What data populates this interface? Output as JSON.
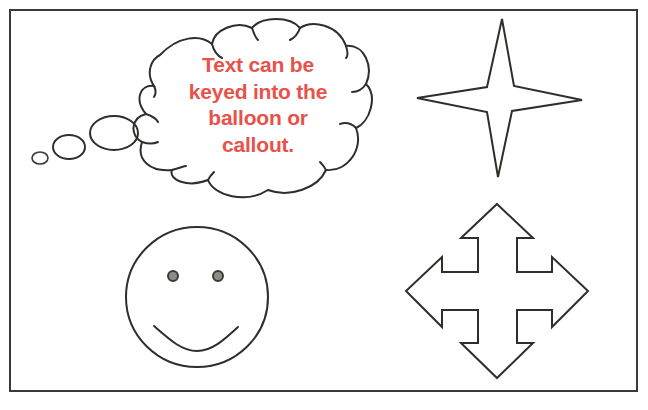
{
  "figure": {
    "frame": {
      "x": 9,
      "y": 9,
      "width": 627,
      "height": 381
    },
    "stroke_color": "#2e2e2a",
    "background": "#ffffff"
  },
  "callout": {
    "type": "thought-balloon",
    "text_lines": [
      "Text can be",
      "keyed into the",
      "balloon or",
      "callout."
    ],
    "text_color": "#e8524a",
    "thought_bubbles": [
      {
        "cx": 40,
        "cy": 158,
        "rx": 8,
        "ry": 6
      },
      {
        "cx": 69,
        "cy": 147,
        "rx": 16,
        "ry": 12
      },
      {
        "cx": 114,
        "cy": 133,
        "rx": 24,
        "ry": 17
      }
    ]
  },
  "shapes": {
    "star": {
      "name": "four-point star",
      "top": [
        502,
        19
      ],
      "right": [
        582,
        100
      ],
      "bottom": [
        498,
        177
      ],
      "left": [
        417,
        98
      ]
    },
    "smiley": {
      "name": "smiley face",
      "cx": 197,
      "cy": 297,
      "r": 71
    },
    "arrow": {
      "name": "four-way arrow",
      "cx": 497,
      "cy": 291
    }
  }
}
